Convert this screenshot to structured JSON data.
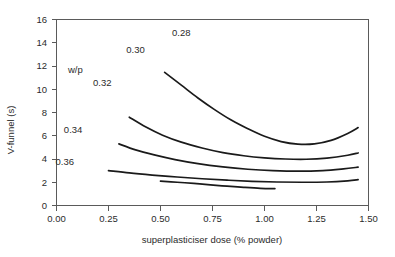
{
  "chart_data": {
    "type": "line",
    "title": "",
    "xlabel": "superplasticiser dose (% powder)",
    "ylabel": "V-funnel (s)",
    "xlim": [
      0.0,
      1.5
    ],
    "ylim": [
      0,
      16
    ],
    "xticks": [
      "0.00",
      "0.25",
      "0.50",
      "0.75",
      "1.00",
      "1.25",
      "1.50"
    ],
    "xtick_values": [
      0.0,
      0.25,
      0.5,
      0.75,
      1.0,
      1.25,
      1.5
    ],
    "yticks": [
      "0",
      "2",
      "4",
      "6",
      "8",
      "10",
      "12",
      "14",
      "16"
    ],
    "ytick_values": [
      0,
      2,
      4,
      6,
      8,
      10,
      12,
      14,
      16
    ],
    "grid": false,
    "legend_position": "inline-annotations",
    "legend_title": "w/p",
    "series": [
      {
        "name": "0.28",
        "label": "0.28",
        "label_x": 0.6,
        "label_y": 14.6,
        "points": [
          [
            0.52,
            11.45
          ],
          [
            0.6,
            10.35
          ],
          [
            0.68,
            9.25
          ],
          [
            0.76,
            8.25
          ],
          [
            0.84,
            7.35
          ],
          [
            0.92,
            6.6
          ],
          [
            1.0,
            5.95
          ],
          [
            1.08,
            5.5
          ],
          [
            1.16,
            5.28
          ],
          [
            1.24,
            5.3
          ],
          [
            1.32,
            5.6
          ],
          [
            1.4,
            6.2
          ],
          [
            1.45,
            6.7
          ]
        ]
      },
      {
        "name": "0.30",
        "label": "0.30",
        "label_x": 0.38,
        "label_y": 13.1,
        "points": [
          [
            0.35,
            7.6
          ],
          [
            0.43,
            6.75
          ],
          [
            0.51,
            6.05
          ],
          [
            0.6,
            5.45
          ],
          [
            0.7,
            4.95
          ],
          [
            0.8,
            4.55
          ],
          [
            0.9,
            4.28
          ],
          [
            1.0,
            4.1
          ],
          [
            1.1,
            4.0
          ],
          [
            1.2,
            3.98
          ],
          [
            1.3,
            4.08
          ],
          [
            1.4,
            4.32
          ],
          [
            1.45,
            4.52
          ]
        ]
      },
      {
        "name": "0.32",
        "label": "0.32",
        "label_x": 0.22,
        "label_y": 10.3,
        "points": [
          [
            0.3,
            5.3
          ],
          [
            0.38,
            4.78
          ],
          [
            0.47,
            4.35
          ],
          [
            0.57,
            3.95
          ],
          [
            0.68,
            3.6
          ],
          [
            0.8,
            3.32
          ],
          [
            0.92,
            3.12
          ],
          [
            1.04,
            3.0
          ],
          [
            1.16,
            2.95
          ],
          [
            1.28,
            3.0
          ],
          [
            1.38,
            3.15
          ],
          [
            1.45,
            3.3
          ]
        ]
      },
      {
        "name": "0.34",
        "label": "0.34",
        "label_x": 0.08,
        "label_y": 6.2,
        "points": [
          [
            0.25,
            3.0
          ],
          [
            0.35,
            2.8
          ],
          [
            0.46,
            2.62
          ],
          [
            0.58,
            2.45
          ],
          [
            0.7,
            2.3
          ],
          [
            0.82,
            2.18
          ],
          [
            0.94,
            2.08
          ],
          [
            1.06,
            2.02
          ],
          [
            1.18,
            2.0
          ],
          [
            1.3,
            2.02
          ],
          [
            1.4,
            2.12
          ],
          [
            1.45,
            2.22
          ]
        ]
      },
      {
        "name": "0.36",
        "label": "0.36",
        "label_x": 0.04,
        "label_y": 3.5,
        "points": [
          [
            0.5,
            2.1
          ],
          [
            0.58,
            2.0
          ],
          [
            0.66,
            1.9
          ],
          [
            0.74,
            1.78
          ],
          [
            0.82,
            1.66
          ],
          [
            0.9,
            1.56
          ],
          [
            0.98,
            1.48
          ],
          [
            1.05,
            1.45
          ]
        ]
      }
    ]
  },
  "axes": {
    "x_title": "superplasticiser dose (% powder)",
    "y_title": "V-funnel (s)"
  },
  "annotations": {
    "wp": "w/p"
  }
}
